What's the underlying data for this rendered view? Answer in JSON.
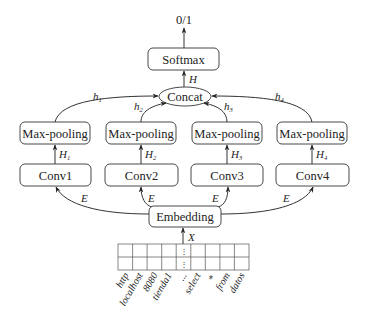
{
  "diagram": {
    "output_label": "0/1",
    "softmax": {
      "label": "Softmax"
    },
    "concat": {
      "label": "Concat",
      "output_label": "H"
    },
    "branches": [
      {
        "conv": "Conv1",
        "pool": "Max-pooling",
        "conv_out": "H",
        "conv_out_sub": "1",
        "pool_out": "h",
        "pool_out_sub": "1",
        "input_label": "E"
      },
      {
        "conv": "Conv2",
        "pool": "Max-pooling",
        "conv_out": "H",
        "conv_out_sub": "2",
        "pool_out": "h",
        "pool_out_sub": "2",
        "input_label": "E"
      },
      {
        "conv": "Conv3",
        "pool": "Max-pooling",
        "conv_out": "H",
        "conv_out_sub": "3",
        "pool_out": "h",
        "pool_out_sub": "3",
        "input_label": "E"
      },
      {
        "conv": "Conv4",
        "pool": "Max-pooling",
        "conv_out": "H",
        "conv_out_sub": "4",
        "pool_out": "h",
        "pool_out_sub": "4",
        "input_label": "E"
      }
    ],
    "embedding": {
      "label": "Embedding",
      "input_label": "X"
    },
    "input_matrix": {
      "rows": 2,
      "columns": 9,
      "ellipsis_column": 5,
      "ellipsis_glyph": "⋮"
    },
    "tokens": [
      "http",
      "localhost",
      "8080",
      "tienda1",
      "...",
      "select",
      "*",
      "from",
      "datos"
    ]
  }
}
